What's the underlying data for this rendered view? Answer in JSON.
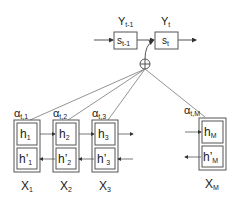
{
  "diagram": {
    "decoder": {
      "states": [
        {
          "label": "s",
          "sub": "t-1",
          "output_label": "Y",
          "output_sub": "t-1"
        },
        {
          "label": "s",
          "sub": "t",
          "output_label": "Y",
          "output_sub": "t"
        }
      ]
    },
    "combiner": {
      "symbol": "⊕"
    },
    "encoder": {
      "columns": [
        {
          "alpha": "α",
          "alpha_sub": "t,1",
          "h": "h",
          "h_sub": "1",
          "hp": "h’",
          "hp_sub": "1",
          "x": "X",
          "x_sub": "1"
        },
        {
          "alpha": "α",
          "alpha_sub": "t,2",
          "h": "h",
          "h_sub": "2",
          "hp": "h’",
          "hp_sub": "2",
          "x": "X",
          "x_sub": "2"
        },
        {
          "alpha": "α",
          "alpha_sub": "t,3",
          "h": "h",
          "h_sub": "3",
          "hp": "h’",
          "hp_sub": "3",
          "x": "X",
          "x_sub": "3"
        },
        {
          "alpha": "α",
          "alpha_sub": "t,M",
          "h": "h",
          "h_sub": "M",
          "hp": "h’",
          "hp_sub": "M",
          "x": "X",
          "x_sub": "M"
        }
      ]
    },
    "colors": {
      "stroke": "#555555",
      "text": "#222222",
      "background": "#ffffff"
    }
  }
}
